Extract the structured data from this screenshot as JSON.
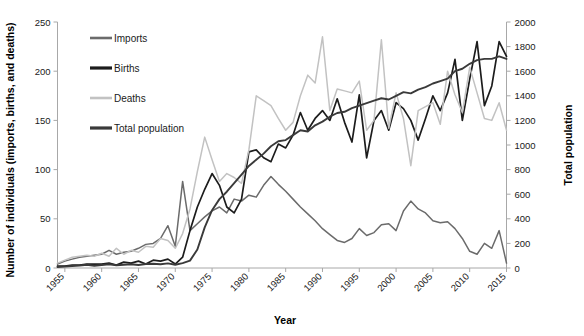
{
  "chart_data": {
    "type": "line",
    "title": "",
    "xlabel": "Year",
    "ylabel": "Number of individuals (imports, births, and deaths)",
    "y2label": "Total population",
    "xlim": [
      1954,
      2015
    ],
    "ylim": [
      0,
      250
    ],
    "y2lim": [
      0,
      2000
    ],
    "grid": false,
    "legend_position": "upper-left-inside",
    "xticks": [
      "1955",
      "1960",
      "1965",
      "1970",
      "1975",
      "1980",
      "1985",
      "1990",
      "1995",
      "2000",
      "2005",
      "2010",
      "2015"
    ],
    "yticks": [
      "0",
      "50",
      "100",
      "150",
      "200",
      "250"
    ],
    "y2ticks": [
      "0",
      "200",
      "400",
      "600",
      "800",
      "1000",
      "1200",
      "1400",
      "1600",
      "1800",
      "2000"
    ],
    "x": [
      1954,
      1955,
      1956,
      1957,
      1958,
      1959,
      1960,
      1961,
      1962,
      1963,
      1964,
      1965,
      1966,
      1967,
      1968,
      1969,
      1970,
      1971,
      1972,
      1973,
      1974,
      1975,
      1976,
      1977,
      1978,
      1979,
      1980,
      1981,
      1982,
      1983,
      1984,
      1985,
      1986,
      1987,
      1988,
      1989,
      1990,
      1991,
      1992,
      1993,
      1994,
      1995,
      1996,
      1997,
      1998,
      1999,
      2000,
      2001,
      2002,
      2003,
      2004,
      2005,
      2006,
      2007,
      2008,
      2009,
      2010,
      2011,
      2012,
      2013,
      2014,
      2015
    ],
    "series": [
      {
        "name": "Imports",
        "color": "#6b6b6b",
        "axis": "left",
        "values": [
          4,
          7,
          9,
          11,
          12,
          13,
          14,
          18,
          14,
          16,
          17,
          20,
          24,
          25,
          30,
          43,
          22,
          88,
          38,
          45,
          52,
          58,
          62,
          56,
          70,
          68,
          74,
          72,
          84,
          93,
          85,
          78,
          70,
          62,
          55,
          48,
          40,
          34,
          28,
          26,
          30,
          40,
          33,
          36,
          44,
          45,
          38,
          58,
          68,
          60,
          56,
          48,
          46,
          47,
          40,
          30,
          17,
          14,
          25,
          20,
          38,
          5
        ]
      },
      {
        "name": "Births",
        "color": "#1c1c1c",
        "axis": "left",
        "values": [
          2,
          2,
          3,
          3,
          4,
          4,
          4,
          5,
          3,
          6,
          5,
          7,
          4,
          8,
          7,
          9,
          4,
          11,
          38,
          62,
          80,
          96,
          84,
          62,
          56,
          70,
          118,
          120,
          112,
          108,
          126,
          122,
          135,
          158,
          140,
          152,
          160,
          150,
          172,
          148,
          128,
          176,
          112,
          150,
          160,
          140,
          168,
          162,
          150,
          130,
          152,
          175,
          160,
          178,
          212,
          150,
          192,
          230,
          165,
          185,
          230,
          215
        ]
      },
      {
        "name": "Deaths",
        "color": "#c2c2c2",
        "axis": "left",
        "values": [
          5,
          8,
          11,
          12,
          13,
          12,
          15,
          12,
          20,
          14,
          18,
          16,
          22,
          21,
          30,
          28,
          20,
          35,
          60,
          98,
          133,
          110,
          88,
          96,
          92,
          86,
          120,
          175,
          170,
          165,
          152,
          140,
          148,
          175,
          196,
          188,
          235,
          160,
          182,
          180,
          178,
          190,
          140,
          150,
          232,
          142,
          178,
          152,
          104,
          160,
          164,
          168,
          146,
          200,
          176,
          158,
          204,
          178,
          152,
          150,
          168,
          140
        ]
      },
      {
        "name": "Total population",
        "color": "#3a3a3a",
        "axis": "right",
        "values": [
          8,
          12,
          16,
          20,
          26,
          18,
          24,
          30,
          22,
          26,
          30,
          24,
          32,
          34,
          30,
          38,
          26,
          40,
          60,
          150,
          330,
          470,
          560,
          620,
          690,
          760,
          830,
          880,
          930,
          990,
          1030,
          1040,
          1080,
          1120,
          1110,
          1160,
          1190,
          1230,
          1260,
          1270,
          1300,
          1320,
          1340,
          1360,
          1380,
          1370,
          1400,
          1430,
          1420,
          1450,
          1470,
          1500,
          1520,
          1540,
          1600,
          1620,
          1660,
          1690,
          1700,
          1700,
          1720,
          1700
        ]
      }
    ]
  },
  "legend": {
    "items": [
      {
        "label": "Imports"
      },
      {
        "label": "Births"
      },
      {
        "label": "Deaths"
      },
      {
        "label": "Total population"
      }
    ]
  },
  "axes": {
    "y_left_title": "Number of individuals (imports, births, and deaths)",
    "y_right_title": "Total population",
    "x_title": "Year"
  }
}
